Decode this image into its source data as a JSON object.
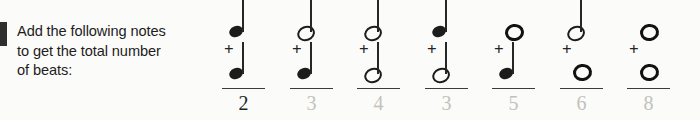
{
  "worksheet": {
    "instruction": {
      "line1": "Add the following notes",
      "line2": "to get the total number",
      "line3": "of beats:"
    },
    "operator": "+",
    "problems": [
      {
        "index": "1",
        "top_note": "quarter-note",
        "top_note_beats": "1",
        "bottom_note": "quarter-note",
        "bottom_note_beats": "1",
        "answer": "2",
        "answer_style": "ink"
      },
      {
        "index": "2",
        "top_note": "half-note",
        "top_note_beats": "2",
        "bottom_note": "quarter-note",
        "bottom_note_beats": "1",
        "answer": "3",
        "answer_style": "pencil"
      },
      {
        "index": "3",
        "top_note": "half-note",
        "top_note_beats": "2",
        "bottom_note": "half-note",
        "bottom_note_beats": "2",
        "answer": "4",
        "answer_style": "pencil"
      },
      {
        "index": "4",
        "top_note": "quarter-note",
        "top_note_beats": "1",
        "bottom_note": "half-note",
        "bottom_note_beats": "2",
        "answer": "3",
        "answer_style": "pencil"
      },
      {
        "index": "5",
        "top_note": "whole-note",
        "top_note_beats": "4",
        "bottom_note": "quarter-note",
        "bottom_note_beats": "1",
        "answer": "5",
        "answer_style": "pencil"
      },
      {
        "index": "6",
        "top_note": "half-note",
        "top_note_beats": "2",
        "bottom_note": "whole-note",
        "bottom_note_beats": "4",
        "answer": "6",
        "answer_style": "pencil"
      },
      {
        "index": "7",
        "top_note": "whole-note",
        "top_note_beats": "4",
        "bottom_note": "whole-note",
        "bottom_note_beats": "4",
        "answer": "8",
        "answer_style": "pencil"
      }
    ],
    "colors": {
      "page_background": "#fbfbf9",
      "ink": "#1f1f1f",
      "pencil": "#c2c2bd",
      "note": "#1c1c1c",
      "edge_marker": "#2e2e2e"
    }
  }
}
